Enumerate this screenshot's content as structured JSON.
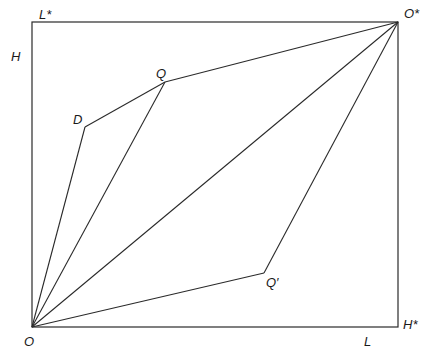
{
  "diagram": {
    "type": "edgeworth-box",
    "stroke_color": "#2a2a2a",
    "box": {
      "x1": 32,
      "y1": 22,
      "x2": 398,
      "y2": 327
    },
    "points": {
      "O": {
        "x": 32,
        "y": 327
      },
      "O_star": {
        "x": 398,
        "y": 22
      },
      "D": {
        "x": 85,
        "y": 127
      },
      "Q": {
        "x": 165,
        "y": 82
      },
      "Q_prime": {
        "x": 264,
        "y": 273
      }
    },
    "labels": {
      "L_star": "L*",
      "O_star": "O*",
      "H": "H",
      "Q": "Q",
      "D": "D",
      "Q_prime": "Q′",
      "O": "O",
      "L": "L",
      "H_star": "H*"
    },
    "segments": [
      {
        "from": "O",
        "to": "D"
      },
      {
        "from": "D",
        "to": "Q"
      },
      {
        "from": "Q",
        "to": "O_star"
      },
      {
        "from": "O",
        "to": "Q"
      },
      {
        "from": "O",
        "to": "O_star"
      },
      {
        "from": "O",
        "to": "Q_prime"
      },
      {
        "from": "Q_prime",
        "to": "O_star"
      }
    ]
  }
}
